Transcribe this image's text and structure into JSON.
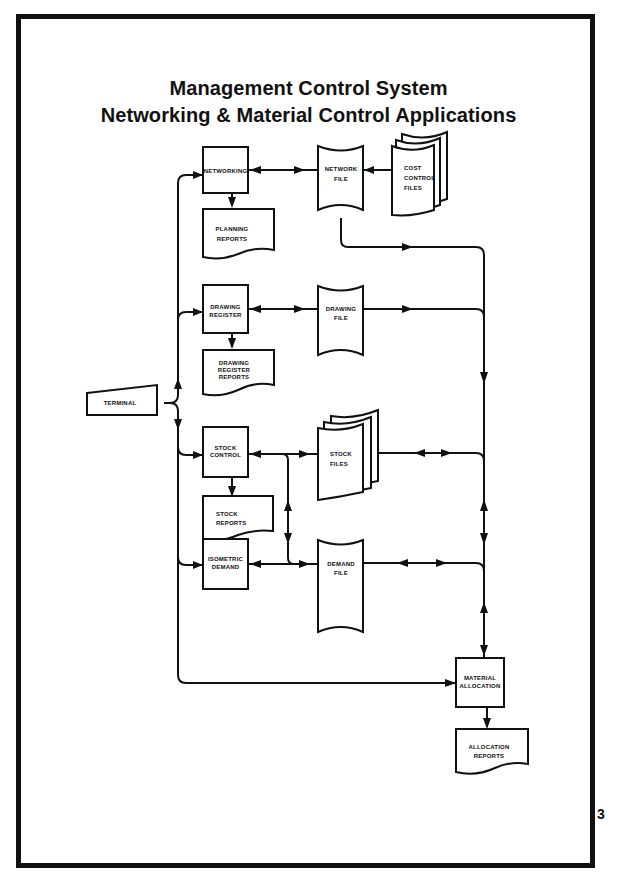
{
  "title": {
    "line1": "Management Control System",
    "line2": "Networking & Material Control Applications"
  },
  "nodes": {
    "terminal": {
      "type": "manual-input",
      "lines": [
        "TERMINAL"
      ]
    },
    "networking": {
      "type": "process",
      "lines": [
        "NETWORKING"
      ]
    },
    "planning_reports": {
      "type": "document",
      "lines": [
        "PLANNING",
        "REPORTS"
      ]
    },
    "network_file": {
      "type": "stored-data",
      "lines": [
        "NETWORK",
        "FILE"
      ]
    },
    "cost_control_files": {
      "type": "stored-data-multiple",
      "lines": [
        "COST",
        "CONTROL",
        "FILES"
      ]
    },
    "drawing_register": {
      "type": "process",
      "lines": [
        "DRAWING",
        "REGISTER"
      ]
    },
    "drawing_register_reports": {
      "type": "document",
      "lines": [
        "DRAWING",
        "REGISTER",
        "REPORTS"
      ]
    },
    "drawing_file": {
      "type": "stored-data",
      "lines": [
        "DRAWING",
        "FILE"
      ]
    },
    "stock_control": {
      "type": "process",
      "lines": [
        "STOCK",
        "CONTROL"
      ]
    },
    "stock_reports": {
      "type": "document",
      "lines": [
        "STOCK",
        "REPORTS"
      ]
    },
    "stock_files": {
      "type": "stored-data-multiple",
      "lines": [
        "STOCK",
        "FILES"
      ]
    },
    "isometric_demand": {
      "type": "process",
      "lines": [
        "ISOMETRIC",
        "DEMAND"
      ]
    },
    "demand_file": {
      "type": "stored-data",
      "lines": [
        "DEMAND",
        "FILE"
      ]
    },
    "material_allocation": {
      "type": "process",
      "lines": [
        "MATERIAL",
        "ALLOCATION"
      ]
    },
    "allocation_reports": {
      "type": "document",
      "lines": [
        "ALLOCATION",
        "REPORTS"
      ]
    }
  },
  "edges": [
    {
      "from": "terminal",
      "to": "networking",
      "direction": "one-way"
    },
    {
      "from": "terminal",
      "to": "drawing_register",
      "direction": "one-way"
    },
    {
      "from": "terminal",
      "to": "stock_control",
      "direction": "one-way"
    },
    {
      "from": "terminal",
      "to": "isometric_demand",
      "direction": "one-way"
    },
    {
      "from": "terminal",
      "to": "material_allocation",
      "direction": "one-way"
    },
    {
      "from": "networking",
      "to": "planning_reports",
      "direction": "one-way"
    },
    {
      "from": "networking",
      "to": "network_file",
      "direction": "two-way"
    },
    {
      "from": "cost_control_files",
      "to": "network_file",
      "direction": "one-way"
    },
    {
      "from": "network_file",
      "to": "material_allocation",
      "direction": "one-way"
    },
    {
      "from": "drawing_register",
      "to": "drawing_register_reports",
      "direction": "one-way"
    },
    {
      "from": "drawing_register",
      "to": "drawing_file",
      "direction": "two-way"
    },
    {
      "from": "drawing_file",
      "to": "material_allocation",
      "direction": "one-way"
    },
    {
      "from": "stock_control",
      "to": "stock_reports",
      "direction": "one-way"
    },
    {
      "from": "stock_control",
      "to": "stock_files",
      "direction": "two-way"
    },
    {
      "from": "stock_control",
      "to": "demand_file",
      "direction": "two-way"
    },
    {
      "from": "stock_files",
      "to": "material_allocation",
      "direction": "two-way"
    },
    {
      "from": "isometric_demand",
      "to": "demand_file",
      "direction": "two-way"
    },
    {
      "from": "demand_file",
      "to": "material_allocation",
      "direction": "two-way"
    },
    {
      "from": "material_allocation",
      "to": "allocation_reports",
      "direction": "one-way"
    }
  ],
  "margin_mark": "3"
}
